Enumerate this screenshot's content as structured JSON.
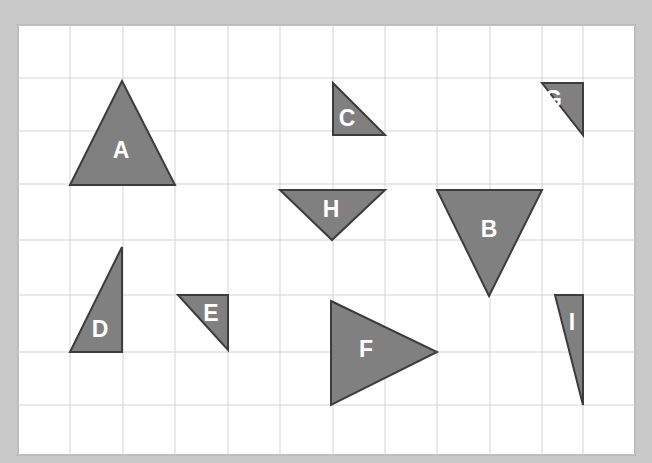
{
  "page": {
    "background_color": "#c9c9c9",
    "paper_color": "#ffffff",
    "paper_border_color": "#a8a8a8"
  },
  "grid": {
    "line_color": "#d0d3d8",
    "x_origin": 18,
    "y_origin": 25,
    "cell_width": 52.5,
    "cell_height": 53.75,
    "columns": 12,
    "rows": 8,
    "x_positions": [
      18,
      70,
      123,
      175,
      228,
      280,
      333,
      385,
      437,
      490,
      542,
      583,
      635
    ],
    "y_positions": [
      25,
      78,
      131,
      184,
      240,
      295,
      352,
      405,
      455
    ]
  },
  "style": {
    "shape_fill": "#808080",
    "shape_stroke": "#3c3c3c",
    "label_color": "#ffffff",
    "label_font_size": 23
  },
  "shapes": [
    {
      "id": "triangle-a",
      "label": "A",
      "points": "122,81 70,185 175,185",
      "label_x": 121,
      "label_y": 152
    },
    {
      "id": "triangle-b",
      "label": "B",
      "points": "437,190 542,190 489,296",
      "label_x": 489,
      "label_y": 231
    },
    {
      "id": "triangle-c",
      "label": "C",
      "points": "333,83 385,135 333,135",
      "label_x": 347,
      "label_y": 120
    },
    {
      "id": "triangle-d",
      "label": "D",
      "points": "122,247 122,352 70,352",
      "label_x": 100,
      "label_y": 331
    },
    {
      "id": "triangle-e",
      "label": "E",
      "points": "178,295 228,295 228,350",
      "label_x": 211,
      "label_y": 315
    },
    {
      "id": "triangle-f",
      "label": "F",
      "points": "331,301 437,352 331,405",
      "label_x": 366,
      "label_y": 351
    },
    {
      "id": "triangle-g",
      "label": "G",
      "points": "583,83 583,135 542,83",
      "label_x": 553,
      "label_y": 101
    },
    {
      "id": "triangle-h",
      "label": "H",
      "points": "280,190 385,190 332,240",
      "label_x": 331,
      "label_y": 211
    },
    {
      "id": "triangle-i",
      "label": "I",
      "points": "555,295 583,295 583,405",
      "label_x": 572,
      "label_y": 324
    }
  ]
}
